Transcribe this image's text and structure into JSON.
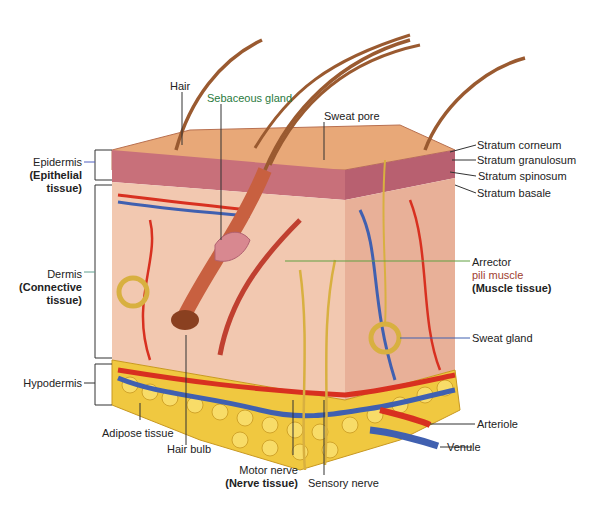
{
  "diagram": {
    "left_labels": {
      "epidermis": "Epidermis",
      "epidermis_tissue": "(Epithelial",
      "epidermis_tissue2": "tissue)",
      "dermis": "Dermis",
      "dermis_tissue": "(Connective",
      "dermis_tissue2": "tissue)",
      "hypodermis": "Hypodermis"
    },
    "top_labels": {
      "hair": "Hair",
      "sebaceous_gland": "Sebaceous gland",
      "sweat_pore": "Sweat pore"
    },
    "right_labels": {
      "stratum_corneum": "Stratum corneum",
      "stratum_granulosum": "Stratum granulosum",
      "stratum_spinosum": "Stratum spinosum",
      "stratum_basale": "Stratum basale",
      "arrector": "Arrector",
      "pili_muscle": "pili muscle",
      "muscle_tissue": "(Muscle tissue)",
      "sweat_gland": "Sweat gland",
      "arteriole": "Arteriole",
      "venule": "Venule"
    },
    "bottom_labels": {
      "adipose_tissue": "Adipose tissue",
      "hair_bulb": "Hair bulb",
      "motor_nerve": "Motor nerve",
      "nerve_tissue": "(Nerve tissue)",
      "sensory_nerve": "Sensory nerve"
    },
    "colors": {
      "skin_top": "#e8a878",
      "epidermis": "#c8707a",
      "dermis": "#f2c8b0",
      "fat": "#f0c840",
      "artery": "#d83020",
      "vein": "#4060b0",
      "nerve": "#d8b040",
      "hair": "#9a5a30"
    }
  }
}
